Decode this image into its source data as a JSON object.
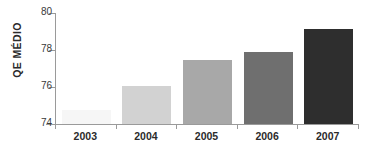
{
  "chart_data": {
    "type": "bar",
    "title": "",
    "title_note": "title cropped off top edge, illegible",
    "xlabel": "",
    "ylabel": "QE MÉDIO",
    "categories": [
      "2003",
      "2004",
      "2005",
      "2006",
      "2007"
    ],
    "values": [
      74.75,
      76.05,
      77.45,
      77.9,
      79.15
    ],
    "ylim": [
      74,
      80
    ],
    "yticks": [
      "74",
      "76",
      "78",
      "80"
    ],
    "ytick_values": [
      74,
      76,
      78,
      80
    ],
    "grid": false,
    "legend": "none",
    "bar_colors": [
      "#f6f6f6",
      "#d2d2d2",
      "#a8a8a8",
      "#6f6f6f",
      "#2e2e2e"
    ]
  },
  "axis": {
    "line_color": "#9a9a9a",
    "tick_label_color": "#3a3a3a",
    "category_label_color": "#2b2b2b"
  },
  "canvas": {
    "background": "#ffffff"
  }
}
